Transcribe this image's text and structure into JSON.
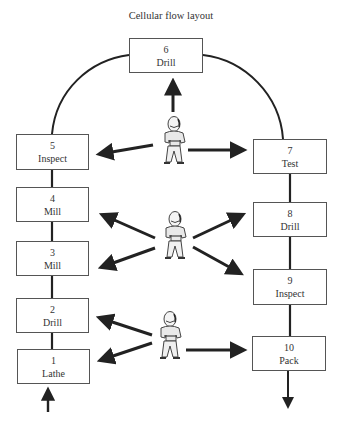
{
  "title": "Cellular flow layout",
  "stations": [
    {
      "number": "1",
      "label": "Lathe"
    },
    {
      "number": "2",
      "label": "Drill"
    },
    {
      "number": "3",
      "label": "Mill"
    },
    {
      "number": "4",
      "label": "Mill"
    },
    {
      "number": "5",
      "label": "Inspect"
    },
    {
      "number": "6",
      "label": "Drill"
    },
    {
      "number": "7",
      "label": "Test"
    },
    {
      "number": "8",
      "label": "Drill"
    },
    {
      "number": "9",
      "label": "Inspect"
    },
    {
      "number": "10",
      "label": "Pack"
    }
  ],
  "workers": [
    {
      "name": "worker-1",
      "serves": [
        "5",
        "6",
        "7"
      ]
    },
    {
      "name": "worker-2",
      "serves": [
        "3",
        "4",
        "8",
        "9"
      ]
    },
    {
      "name": "worker-3",
      "serves": [
        "1",
        "2",
        "10"
      ]
    }
  ],
  "flow": {
    "entry": "material-in-arrow",
    "exit": "product-out-arrow"
  }
}
